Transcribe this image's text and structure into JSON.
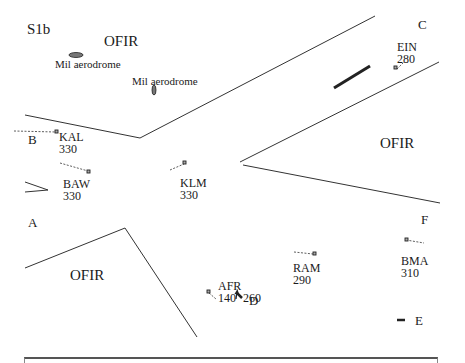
{
  "figure": {
    "label": "S1b",
    "regions": [
      {
        "name": "OFIR",
        "x": 62,
        "y": 34
      },
      {
        "name": "OFIR",
        "x": 353,
        "y": 136
      },
      {
        "name": "OFIR",
        "x": 70,
        "y": 278
      }
    ],
    "aerodromes": [
      {
        "label": "Mil aerodrome",
        "x": 55,
        "y": 59
      },
      {
        "label": "Mil aerodrome",
        "x": 132,
        "y": 77
      }
    ],
    "points": [
      {
        "label": "A",
        "x": 4,
        "y": 222
      },
      {
        "label": "B",
        "x": 28,
        "y": 132
      },
      {
        "label": "C",
        "x": 418,
        "y": 18
      },
      {
        "label": "D",
        "x": 249,
        "y": 296
      },
      {
        "label": "E",
        "x": 415,
        "y": 287
      },
      {
        "label": "F",
        "x": 421,
        "y": 213
      }
    ],
    "aircraft": [
      {
        "callsign": "KAL",
        "level": "330"
      },
      {
        "callsign": "BAW",
        "level": "330"
      },
      {
        "callsign": "KLM",
        "level": "330"
      },
      {
        "callsign": "EIN",
        "level": "280"
      },
      {
        "callsign": "RAM",
        "level": "290"
      },
      {
        "callsign": "BMA",
        "level": "310"
      },
      {
        "callsign": "AFR",
        "level": "140",
        "cleared_level": "260"
      }
    ]
  }
}
